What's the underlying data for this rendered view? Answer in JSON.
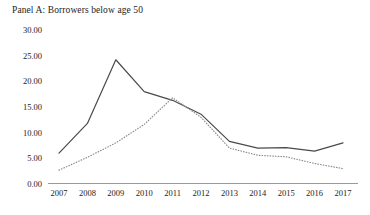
{
  "panel": {
    "title": "Panel A: Borrowers below age 50"
  },
  "axis": {
    "y_ticks": [
      "30.00",
      "25.00",
      "20.00",
      "15.00",
      "10.00",
      "5.00",
      "0.00"
    ],
    "x_ticks": [
      "2007",
      "2008",
      "2009",
      "2010",
      "2011",
      "2012",
      "2013",
      "2014",
      "2015",
      "2016",
      "2017"
    ]
  },
  "colors": {
    "line_solid": "#4a4a4a",
    "line_dotted": "#8e8e8e",
    "axis": "#9a9a9a",
    "text": "#1c1c1c",
    "background": "#ffffff"
  },
  "chart_data": {
    "type": "line",
    "title": "Panel A: Borrowers below age 50",
    "xlabel": "",
    "ylabel": "",
    "x": [
      2007,
      2008,
      2009,
      2010,
      2011,
      2012,
      2013,
      2014,
      2015,
      2016,
      2017
    ],
    "categories": [
      "2007",
      "2008",
      "2009",
      "2010",
      "2011",
      "2012",
      "2013",
      "2014",
      "2015",
      "2016",
      "2017"
    ],
    "ylim": [
      0,
      30
    ],
    "yticks": [
      0,
      5,
      10,
      15,
      20,
      25,
      30
    ],
    "grid": false,
    "legend": "none",
    "series": [
      {
        "name": "solid-series",
        "style": "solid",
        "color": "#4a4a4a",
        "values": [
          6.0,
          11.8,
          24.2,
          18.0,
          16.3,
          13.6,
          8.3,
          7.0,
          7.1,
          6.4,
          8.0
        ]
      },
      {
        "name": "dotted-series",
        "style": "dotted",
        "color": "#8e8e8e",
        "values": [
          2.7,
          5.2,
          8.0,
          11.6,
          16.8,
          13.0,
          7.0,
          5.6,
          5.3,
          4.0,
          3.0
        ]
      }
    ]
  }
}
